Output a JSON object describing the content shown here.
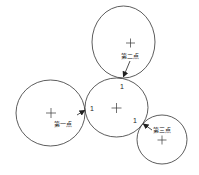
{
  "diagram": {
    "colors": {
      "stroke": "#333333",
      "background": "#ffffff"
    },
    "circles": [
      {
        "id": "top",
        "cx": 123.5,
        "cy": 42,
        "rx": 31.5,
        "ry": 36
      },
      {
        "id": "center",
        "cx": 116.5,
        "cy": 107.5,
        "rx": 31.5,
        "ry": 29.5
      },
      {
        "id": "left",
        "cx": 50.5,
        "cy": 113,
        "rx": 34.5,
        "ry": 33
      },
      {
        "id": "bottom-right",
        "cx": 162,
        "cy": 139.5,
        "rx": 25,
        "ry": 24.5
      }
    ],
    "labels": {
      "second_point": "第二点",
      "first_point": "第一点",
      "third_point": "第三点",
      "tangent_top": "1",
      "tangent_left": "1",
      "tangent_right": "1"
    }
  }
}
